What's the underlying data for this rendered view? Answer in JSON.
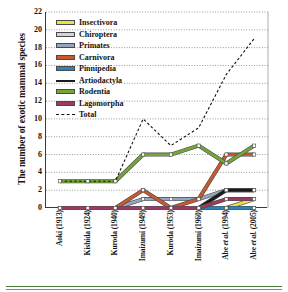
{
  "chart_data": {
    "type": "line",
    "title": "",
    "xlabel": "",
    "ylabel": "The number of exotic mammal species",
    "ylim": [
      0,
      22
    ],
    "ytick_step": 2,
    "yticks": [
      22,
      20,
      18,
      16,
      14,
      12,
      10,
      8,
      6,
      4,
      2,
      0
    ],
    "grid": true,
    "legend_position": "top-left",
    "categories": [
      "Aoki (1913)",
      "Kishida (1924)",
      "Kuroda (1940)",
      "Imaizumi (1949)",
      "Kuroda (1953)",
      "Imaizumi (1960)",
      "Abe et al. (1994)",
      "Abe et al. (2005)"
    ],
    "series": [
      {
        "name": "Insectivora",
        "color": "#e8e24a",
        "style": "solid",
        "marker": true,
        "values": [
          0,
          0,
          0,
          0,
          0,
          0,
          0,
          1
        ]
      },
      {
        "name": "Chiroptera",
        "color": "#d8d2d8",
        "style": "solid",
        "marker": true,
        "values": [
          0,
          0,
          0,
          0,
          0,
          0,
          0,
          0
        ]
      },
      {
        "name": "Primates",
        "color": "#97a4bd",
        "style": "solid",
        "marker": true,
        "values": [
          0,
          0,
          0,
          1,
          1,
          1,
          2,
          2
        ]
      },
      {
        "name": "Carnivora",
        "color": "#c6592f",
        "style": "solid",
        "marker": true,
        "values": [
          0,
          0,
          0,
          2,
          0,
          1,
          6,
          6
        ]
      },
      {
        "name": "Pinnipedia",
        "color": "#2e84b8",
        "style": "solid",
        "marker": true,
        "values": [
          0,
          0,
          0,
          0,
          0,
          0,
          0,
          0
        ]
      },
      {
        "name": "Artiodactyla",
        "color": "#1a1a1a",
        "style": "solid",
        "marker": true,
        "values": [
          0,
          0,
          0,
          0,
          0,
          0,
          2,
          2
        ]
      },
      {
        "name": "Rodentia",
        "color": "#76a53a",
        "style": "solid",
        "marker": true,
        "values": [
          3,
          3,
          3,
          6,
          6,
          7,
          5,
          7
        ]
      },
      {
        "name": "Lagomorpha",
        "color": "#9b3b63",
        "style": "solid",
        "marker": true,
        "values": [
          0,
          0,
          0,
          0,
          0,
          0,
          1,
          1
        ]
      },
      {
        "name": "Total",
        "color": "#111111",
        "style": "dashed",
        "marker": false,
        "values": [
          3,
          3,
          3,
          10,
          7,
          9,
          15,
          19
        ]
      }
    ]
  },
  "legend": {
    "items": [
      "Insectivora",
      "Chiroptera",
      "Primates",
      "Carnivora",
      "Pinnipedia",
      "Artiodactyla",
      "Rodentia",
      "Lagomorpha",
      "Total"
    ]
  },
  "axis": {
    "y_title": "The number of exotic mammal species",
    "y_tick_labels": [
      "22",
      "20",
      "18",
      "16",
      "14",
      "12",
      "10",
      "8",
      "6",
      "4",
      "2",
      "0"
    ],
    "x_tick_labels": [
      "Aoki (1913)",
      "Kishida (1924)",
      "Kuroda (1940)",
      "Imaizumi (1949)",
      "Kuroda (1953)",
      "Imaizumi (1960)",
      "Abe et al. (1994)",
      "Abe et al. (2005)"
    ]
  }
}
